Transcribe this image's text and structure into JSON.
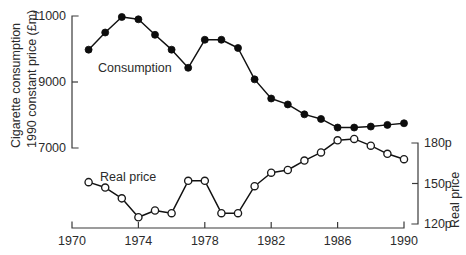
{
  "chart_data": {
    "type": "line",
    "title": "",
    "xlabel": "",
    "x_ticks": [
      "1970",
      "1974",
      "1978",
      "1982",
      "1986",
      "1990"
    ],
    "x_tick_values": [
      1970,
      1974,
      1978,
      1982,
      1986,
      1990
    ],
    "xlim": [
      1970,
      1990
    ],
    "grid": false,
    "legend_position": "inline-annotations",
    "axes": [
      {
        "id": "left",
        "side": "left",
        "label_line1": "Cigarette consumption",
        "label_line2": "1990 constant price (£m)",
        "ticks": [
          "11000",
          "9000",
          "7000"
        ],
        "tick_values": [
          11000,
          9000,
          7000
        ],
        "ylim": [
          7000,
          11000
        ]
      },
      {
        "id": "right",
        "side": "right",
        "label": "Real price",
        "ticks": [
          "180p",
          "150p",
          "120p"
        ],
        "tick_values": [
          180,
          150,
          120
        ],
        "ylim": [
          120,
          180
        ]
      }
    ],
    "x": [
      1971,
      1972,
      1973,
      1974,
      1975,
      1976,
      1977,
      1978,
      1979,
      1980,
      1981,
      1982,
      1983,
      1984,
      1985,
      1986,
      1987,
      1988,
      1989,
      1990
    ],
    "series": [
      {
        "name": "Consumption",
        "axis": "left",
        "marker": "filled-circle",
        "annotation": "Consumption",
        "values": [
          9980,
          10500,
          10970,
          10900,
          10430,
          9980,
          9430,
          10280,
          10280,
          10030,
          9080,
          8500,
          8320,
          8020,
          7880,
          7620,
          7620,
          7650,
          7700,
          7750
        ]
      },
      {
        "name": "Real price",
        "axis": "right",
        "marker": "open-circle",
        "annotation": "Real price",
        "values": [
          151,
          147,
          139,
          125,
          130,
          128,
          152,
          152,
          128,
          128,
          148,
          158,
          160,
          167,
          173,
          182,
          183,
          178,
          172,
          168
        ]
      }
    ]
  },
  "colors": {
    "ink": "#111111",
    "axis": "#3a3a3a",
    "background": "#ffffff",
    "marker_open_fill": "#ffffff"
  }
}
